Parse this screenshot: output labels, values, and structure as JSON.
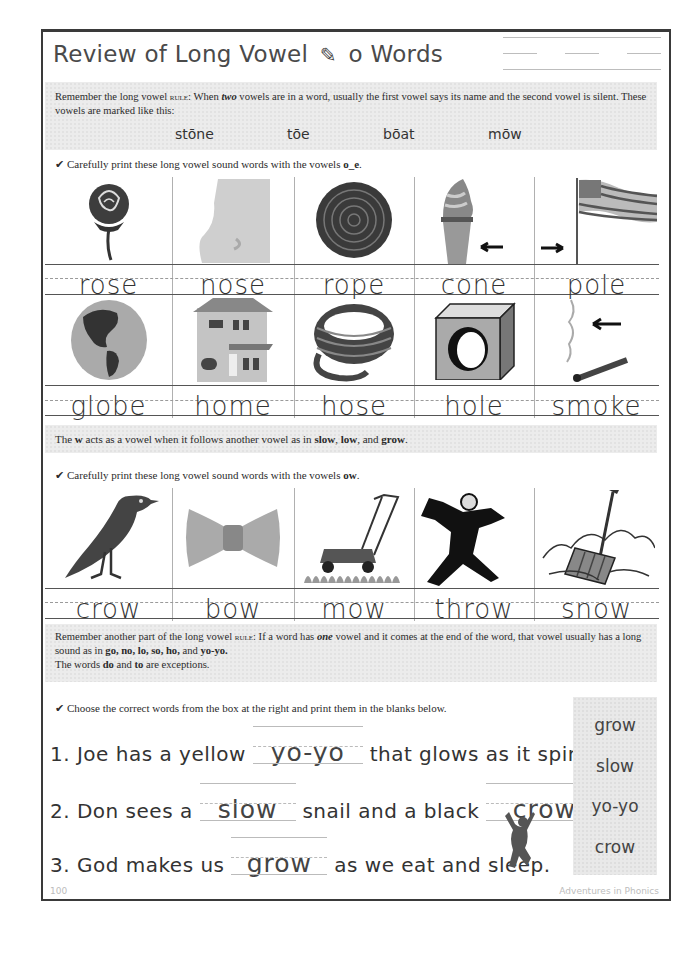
{
  "header": {
    "title_before": "Review of Long Vowel",
    "title_icon": "pencil-icon",
    "title_icon_glyph": "✎",
    "title_after": "o Words"
  },
  "rule1": {
    "text_a": "Remember the long vowel ",
    "rule_word": "rule",
    "text_b": ": When ",
    "emph": "two",
    "text_c": " vowels are in a word, usually the first vowel says its name and the second vowel is silent. These vowels are marked like this:",
    "examples": [
      "stōne",
      "tōe",
      "bōat",
      "mōw"
    ]
  },
  "section1": {
    "check_glyph": "✔",
    "instruction_a": "Carefully print these long vowel sound words with the vowels ",
    "instruction_bold": "o_e",
    "instruction_end": ".",
    "row1": [
      {
        "word": "rose",
        "picture": "rose-picture"
      },
      {
        "word": "nose",
        "picture": "nose-picture"
      },
      {
        "word": "rope",
        "picture": "rope-picture"
      },
      {
        "word": "cone",
        "picture": "ice-cream-cone-picture"
      },
      {
        "word": "pole",
        "picture": "flag-pole-picture"
      }
    ],
    "row2": [
      {
        "word": "globe",
        "picture": "globe-picture"
      },
      {
        "word": "home",
        "picture": "house-picture"
      },
      {
        "word": "hose",
        "picture": "garden-hose-picture"
      },
      {
        "word": "hole",
        "picture": "box-with-hole-picture"
      },
      {
        "word": "smoke",
        "picture": "match-smoke-picture"
      }
    ]
  },
  "w_note": {
    "text_a": "The ",
    "w": "w",
    "text_b": " acts as a vowel when it follows another vowel as in ",
    "ex1": "slow",
    "sep1": ", ",
    "ex2": "low",
    "sep2": ", and ",
    "ex3": "grow",
    "end": "."
  },
  "section2": {
    "check_glyph": "✔",
    "instruction_a": "Carefully print these long vowel sound words with the vowels ",
    "instruction_bold": "ow",
    "instruction_end": ".",
    "row": [
      {
        "word": "crow",
        "picture": "crow-bird-picture"
      },
      {
        "word": "bow",
        "picture": "bow-tie-picture"
      },
      {
        "word": "mow",
        "picture": "lawn-mower-picture"
      },
      {
        "word": "throw",
        "picture": "pitcher-picture"
      },
      {
        "word": "snow",
        "picture": "snow-shovel-picture"
      }
    ]
  },
  "rule2": {
    "line1_a": "Remember another part of the long vowel ",
    "rule_word": "rule",
    "line1_b": ": If a word has ",
    "emph": "one",
    "line1_c": " vowel and it comes at the end of the word, that vowel usually has a long sound as in ",
    "examples": "go, no, lo, so, ho,",
    "and": " and ",
    "last": "yo-yo.",
    "line3_a": "The words ",
    "ex_do": "do",
    "line3_b": " and ",
    "ex_to": "to",
    "line3_c": " are exceptions."
  },
  "section3": {
    "check_glyph": "✔",
    "instruction": "Choose the correct words from the box at the right and print them in the blanks below.",
    "sentences": [
      {
        "before": "1.  Joe has a yellow",
        "answer": "yo-yo",
        "after": "that glows as it spins."
      },
      {
        "before": "2. Don sees a",
        "answer": "slow",
        "middle": "snail and a black",
        "answer2": "crow",
        "after": "."
      },
      {
        "before": "3. God makes us",
        "answer": "grow",
        "after": "as we eat and sleep."
      }
    ],
    "word_box": [
      "grow",
      "slow",
      "yo-yo",
      "crow"
    ]
  },
  "footer": {
    "page_number": "100",
    "book_title": "Adventures in Phonics"
  }
}
